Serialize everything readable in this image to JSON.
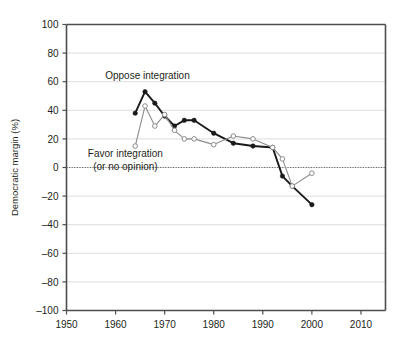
{
  "chart_data": {
    "type": "line",
    "title": "",
    "xlabel": "",
    "ylabel": "Democratic margin (%)",
    "xlim": [
      1950,
      2015
    ],
    "ylim": [
      -100,
      100
    ],
    "grid": true,
    "grid_axis": "y",
    "legend": "inline-annotations",
    "xticks": [
      1950,
      1960,
      1970,
      1980,
      1990,
      2000,
      2010
    ],
    "xtick_labels": [
      "1950",
      "1960",
      "1970",
      "1980",
      "1990",
      "2000",
      "2010"
    ],
    "yticks": [
      100,
      80,
      60,
      40,
      20,
      0,
      -20,
      -40,
      -60,
      -80,
      -100
    ],
    "ytick_labels": [
      "100",
      "80",
      "60",
      "40",
      "20",
      "0",
      "–20",
      "–40",
      "–60",
      "–80",
      "–100"
    ],
    "zero_line": 0,
    "annotations": [
      {
        "name": "oppose-label",
        "text": "Oppose integration",
        "x": 1966.5,
        "y": 62
      },
      {
        "name": "favor-label-line1",
        "text": "Favor integration",
        "x": 1962.0,
        "y": 7
      },
      {
        "name": "favor-label-line2",
        "text": "(or no opinion)",
        "x": 1962.0,
        "y": -2
      }
    ],
    "series": [
      {
        "name": "Oppose integration",
        "color": "#1a1a1a",
        "marker": "filled-circle",
        "x": [
          1964,
          1966,
          1968,
          1970,
          1972,
          1974,
          1976,
          1980,
          1984,
          1988,
          1992,
          1994,
          1996,
          2000
        ],
        "values": [
          38,
          53,
          45,
          36,
          29,
          33,
          33,
          24,
          17,
          15,
          14,
          -6,
          -13,
          -26
        ]
      },
      {
        "name": "Favor integration (or no opinion)",
        "color": "#8c8c8c",
        "marker": "open-circle",
        "x": [
          1964,
          1966,
          1968,
          1970,
          1972,
          1974,
          1976,
          1980,
          1984,
          1988,
          1992,
          1994,
          1996,
          2000
        ],
        "values": [
          15,
          43,
          29,
          37,
          26,
          20,
          20,
          16,
          22,
          20,
          14,
          6,
          -13,
          -4
        ]
      }
    ]
  }
}
